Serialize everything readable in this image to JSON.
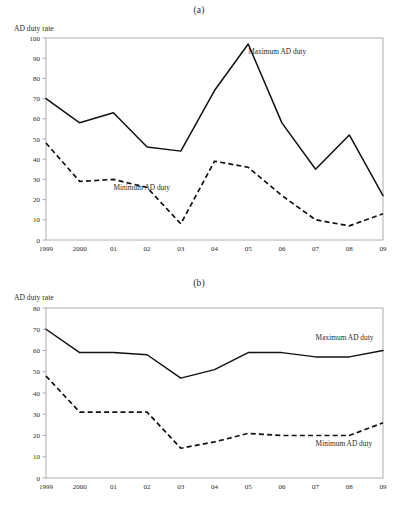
{
  "figure": {
    "panels": [
      {
        "caption": "(a)",
        "axis_title": "AD duty rate"
      },
      {
        "caption": "(b)",
        "axis_title": "AD duty rate"
      }
    ]
  },
  "labels": {
    "maximum": "Maximum AD duty",
    "minimum": "Minimum AD duty"
  },
  "chart_data": [
    {
      "type": "line",
      "title": "(a)",
      "xlabel": "",
      "ylabel": "AD duty rate",
      "ylim": [
        0,
        100
      ],
      "yticks": [
        0,
        10,
        20,
        30,
        40,
        50,
        60,
        70,
        80,
        90,
        100
      ],
      "categories": [
        "1999",
        "2000",
        "01",
        "02",
        "03",
        "04",
        "05",
        "06",
        "07",
        "08",
        "09"
      ],
      "grid": false,
      "legend": "inline-annotation",
      "series": [
        {
          "name": "Maximum AD duty",
          "style": "solid",
          "values": [
            70,
            58,
            63,
            46,
            44,
            74,
            97,
            58,
            35,
            52,
            22
          ]
        },
        {
          "name": "Minimum AD duty",
          "style": "dashed",
          "values": [
            48,
            29,
            30,
            26,
            8,
            39,
            36,
            22,
            10,
            7,
            13
          ]
        }
      ],
      "annotations": [
        {
          "text": "Maximum AD duty",
          "x": "05",
          "y": 92
        },
        {
          "text": "Minimum AD duty",
          "x": "01",
          "y": 25
        }
      ]
    },
    {
      "type": "line",
      "title": "(b)",
      "xlabel": "",
      "ylabel": "AD duty rate",
      "ylim": [
        0,
        80
      ],
      "yticks": [
        0,
        10,
        20,
        30,
        40,
        50,
        60,
        70,
        80
      ],
      "categories": [
        "1999",
        "2000",
        "01",
        "02",
        "03",
        "04",
        "05",
        "06",
        "07",
        "08",
        "09"
      ],
      "grid": false,
      "legend": "inline-annotation",
      "series": [
        {
          "name": "Maximum AD duty",
          "style": "solid",
          "values": [
            70,
            59,
            59,
            58,
            47,
            51,
            59,
            59,
            57,
            57,
            60
          ]
        },
        {
          "name": "Minimum AD duty",
          "style": "dashed",
          "values": [
            48,
            31,
            31,
            31,
            14,
            17,
            21,
            20,
            20,
            20,
            26
          ]
        }
      ],
      "annotations": [
        {
          "text": "Maximum AD duty",
          "x": "07",
          "y": 65
        },
        {
          "text": "Minimum AD duty",
          "x": "07",
          "y": 15
        }
      ]
    }
  ]
}
